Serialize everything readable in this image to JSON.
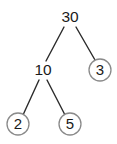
{
  "figure": {
    "kind": "binary-tree-diagram",
    "background_color": "#ffffff",
    "edge_color": "#2b2b2b",
    "circle_stroke_color": "#8a8a8a",
    "label_color": "#1a1a1a",
    "width": 117,
    "height": 144
  },
  "tree": {
    "nodes": [
      {
        "id": "root",
        "label": "30",
        "cx": 70,
        "cy": 17,
        "r": 0,
        "circled": false,
        "level": 0
      },
      {
        "id": "left",
        "label": "10",
        "cx": 43,
        "cy": 70,
        "r": 0,
        "circled": false,
        "level": 1
      },
      {
        "id": "right",
        "label": "3",
        "cx": 100,
        "cy": 70,
        "r": 11,
        "circled": true,
        "level": 1
      },
      {
        "id": "left-left",
        "label": "2",
        "cx": 18,
        "cy": 124,
        "r": 11,
        "circled": true,
        "level": 2
      },
      {
        "id": "left-right",
        "label": "5",
        "cx": 70,
        "cy": 124,
        "r": 11,
        "circled": true,
        "level": 2
      }
    ],
    "edges": [
      {
        "from": "root",
        "to": "left",
        "x1": 64,
        "y1": 27,
        "x2": 46,
        "y2": 61
      },
      {
        "from": "root",
        "to": "right",
        "x1": 76,
        "y1": 27,
        "x2": 95,
        "y2": 60
      },
      {
        "from": "left",
        "to": "left-left",
        "x1": 39,
        "y1": 80,
        "x2": 23,
        "y2": 115
      },
      {
        "from": "left",
        "to": "left-right",
        "x1": 47,
        "y1": 80,
        "x2": 65,
        "y2": 115
      }
    ]
  }
}
